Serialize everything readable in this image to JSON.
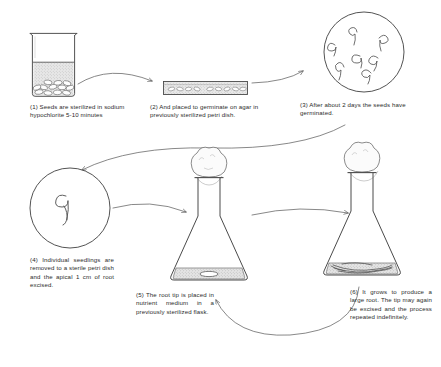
{
  "document": {
    "title": "Aseptic root-tip culture procedure",
    "medium": "hand-drawn line illustration",
    "background_color": "#ffffff",
    "ink_color": "#3a3a3a"
  },
  "steps": [
    {
      "number": "(1)",
      "caption": "(1) Seeds are sterilized in sodium hypochlorite 5-10 minutes",
      "illustration": "beaker-with-seeds",
      "illustration_label": "beaker of sodium hypochlorite containing seeds"
    },
    {
      "number": "(2)",
      "caption": "(2) And placed to germinate on agar in previously sterilized petri dish.",
      "illustration": "petri-dish-side-view",
      "illustration_label": "petri dish side view with seeds on agar"
    },
    {
      "number": "(3)",
      "caption": "(3) After about 2 days the seeds have germinated.",
      "illustration": "petri-dish-top-view-germinated",
      "illustration_label": "petri dish top view with germinated seedlings"
    },
    {
      "number": "(4)",
      "caption": "(4) Individual seedlings are removed to a sterile petri dish and the apical 1 cm of root excised.",
      "illustration": "petri-dish-single-seedling",
      "illustration_label": "petri dish with one seedling"
    },
    {
      "number": "(5)",
      "caption": "(5) The root tip is placed in nutrient medium in a previously sterilized flask.",
      "illustration": "flask-with-root-tip",
      "illustration_label": "stoppered conical flask with root tip in nutrient medium"
    },
    {
      "number": "(6)",
      "caption": "(6) It grows to produce a large root. The tip may again be excised and the process repeated indefinitely.",
      "illustration": "flask-with-large-root",
      "illustration_label": "stoppered conical flask with large branched root"
    }
  ],
  "arrows": [
    {
      "name": "arrow-step1-to-step2",
      "from": "(1)",
      "to": "(2)",
      "shape": "curve-right"
    },
    {
      "name": "arrow-step2-to-step3",
      "from": "(2)",
      "to": "(3)",
      "shape": "curve-up-right"
    },
    {
      "name": "arrow-step3-to-step4",
      "from": "(3)",
      "to": "(4)",
      "shape": "long-s-curve-left"
    },
    {
      "name": "arrow-step4-to-step5",
      "from": "(4)",
      "to": "(5)",
      "shape": "curve-right"
    },
    {
      "name": "arrow-step5-to-step6",
      "from": "(5)",
      "to": "(6)",
      "shape": "curve-right"
    },
    {
      "name": "arrow-step6-to-step5-feedback",
      "from": "(6)",
      "to": "(5)",
      "shape": "u-curve-feedback"
    }
  ],
  "details": {
    "germinated_seedling_count": 7,
    "seeds_in_petri_dish_count": 9
  }
}
